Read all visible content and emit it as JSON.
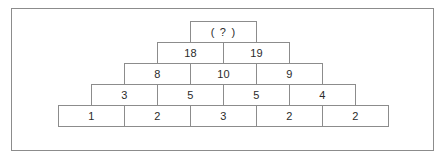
{
  "diagram": {
    "name": "number-pyramid-puzzle",
    "description_visible": false,
    "colors": {
      "border": "#8c8c8c",
      "text": "#2b2b2b",
      "background": "#ffffff"
    },
    "rows": [
      {
        "index": 0,
        "cells": [
          {
            "value": "( ? )",
            "unknown": true
          }
        ]
      },
      {
        "index": 1,
        "cells": [
          {
            "value": "18",
            "unknown": false
          },
          {
            "value": "19",
            "unknown": false
          }
        ]
      },
      {
        "index": 2,
        "cells": [
          {
            "value": "8",
            "unknown": false
          },
          {
            "value": "10",
            "unknown": false
          },
          {
            "value": "9",
            "unknown": false
          }
        ]
      },
      {
        "index": 3,
        "cells": [
          {
            "value": "3",
            "unknown": false
          },
          {
            "value": "5",
            "unknown": false
          },
          {
            "value": "5",
            "unknown": false
          },
          {
            "value": "4",
            "unknown": false
          }
        ]
      },
      {
        "index": 4,
        "cells": [
          {
            "value": "1",
            "unknown": false
          },
          {
            "value": "2",
            "unknown": false
          },
          {
            "value": "3",
            "unknown": false
          },
          {
            "value": "2",
            "unknown": false
          },
          {
            "value": "2",
            "unknown": false
          }
        ]
      }
    ]
  }
}
